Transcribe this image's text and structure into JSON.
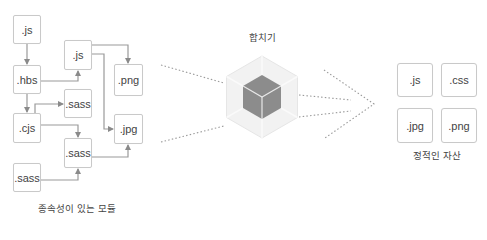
{
  "header": {
    "clipped_title": ""
  },
  "left_group": {
    "caption": "종속성이 있는 모듈",
    "modules": [
      {
        "id": "js_top",
        "label": ".js"
      },
      {
        "id": "hbs",
        "label": ".hbs"
      },
      {
        "id": "js_inner",
        "label": ".js"
      },
      {
        "id": "png",
        "label": ".png"
      },
      {
        "id": "sass_top",
        "label": ".sass"
      },
      {
        "id": "cjs",
        "label": ".cjs"
      },
      {
        "id": "jpg",
        "label": ".jpg"
      },
      {
        "id": "sass_mid",
        "label": ".sass"
      },
      {
        "id": "sass_bottom",
        "label": ".sass"
      }
    ],
    "edges": [
      [
        "js_top",
        "hbs"
      ],
      [
        "hbs",
        "js_inner"
      ],
      [
        "hbs",
        "cjs"
      ],
      [
        "cjs",
        "sass_top"
      ],
      [
        "cjs",
        "sass_mid"
      ],
      [
        "js_inner",
        "png"
      ],
      [
        "js_inner",
        "jpg"
      ],
      [
        "sass_mid",
        "jpg"
      ],
      [
        "sass_bottom",
        "sass_mid"
      ]
    ]
  },
  "center": {
    "label": "합치기",
    "icon": "bundler-cube-icon"
  },
  "right_group": {
    "caption": "정적인 자산",
    "assets": [
      {
        "label": ".js"
      },
      {
        "label": ".css"
      },
      {
        "label": ".jpg"
      },
      {
        "label": ".png"
      }
    ]
  },
  "colors": {
    "box_border": "#c9c9c9",
    "arrow": "#8a8a8a",
    "dots": "#9a9a9a",
    "hex_light": "#f0f0f0",
    "cube": "#8c8c8c"
  }
}
